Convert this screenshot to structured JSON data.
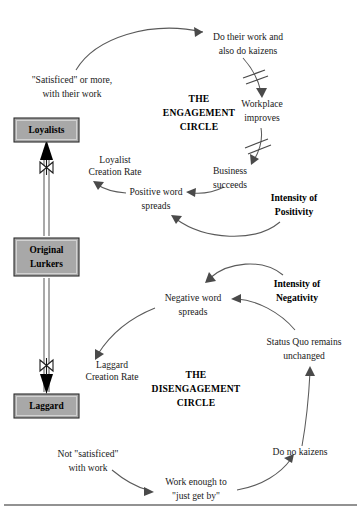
{
  "diagram": {
    "colors": {
      "stock_fill": "#a8a8a8",
      "stock_stroke": "#2b2b2b",
      "link_stroke": "#5a5a5a",
      "text": "#1a1a1a",
      "footer_rule": "#6e6e6e"
    },
    "loops": [
      {
        "id": "engagement",
        "title_lines": [
          "THE",
          "ENGAGEMENT",
          "CIRCLE"
        ]
      },
      {
        "id": "disengagement",
        "title_lines": [
          "THE",
          "DISENGAGEMENT",
          "CIRCLE"
        ]
      }
    ],
    "stocks": [
      {
        "id": "loyalists",
        "lines": [
          "Loyalists"
        ]
      },
      {
        "id": "original-lurkers",
        "lines": [
          "Original",
          "Lurkers"
        ]
      },
      {
        "id": "laggard",
        "lines": [
          "Laggard"
        ]
      }
    ],
    "rates": [
      {
        "id": "loyalist-creation-rate",
        "lines": [
          "Loyalist",
          "Creation Rate"
        ]
      },
      {
        "id": "laggard-creation-rate",
        "lines": [
          "Laggard",
          "Creation Rate"
        ]
      }
    ],
    "nodes": [
      {
        "id": "do-work-kaizens",
        "lines": [
          "Do their work and",
          "also do kaizens"
        ]
      },
      {
        "id": "workplace-improves",
        "lines": [
          "Workplace",
          "improves"
        ]
      },
      {
        "id": "business-succeeds",
        "lines": [
          "Business",
          "succeeds"
        ]
      },
      {
        "id": "positive-word-spreads",
        "lines": [
          "Positive word",
          "spreads"
        ]
      },
      {
        "id": "satisficed-or-more",
        "lines": [
          "\"Satisficed\" or more,",
          "with their work"
        ]
      },
      {
        "id": "intensity-of-positivity",
        "lines": [
          "Intensity of",
          "Positivity"
        ]
      },
      {
        "id": "negative-word-spreads",
        "lines": [
          "Negative word",
          "spreads"
        ]
      },
      {
        "id": "intensity-of-negativity",
        "lines": [
          "Intensity of",
          "Negativity"
        ]
      },
      {
        "id": "status-quo-unchanged",
        "lines": [
          "Status Quo remains",
          "unchanged"
        ]
      },
      {
        "id": "do-no-kaizens",
        "lines": [
          "Do no kaizens"
        ]
      },
      {
        "id": "work-just-get-by",
        "lines": [
          "Work enough to",
          "\"just get by\""
        ]
      },
      {
        "id": "not-satisficed",
        "lines": [
          "Not \"satisficed\"",
          "with work"
        ]
      }
    ],
    "text": {
      "satisficed_line1": "\"Satisficed\" or more,",
      "satisficed_line2": "with their work",
      "do_work_line1": "Do their work and",
      "do_work_line2": "also do kaizens",
      "workplace_line1": "Workplace",
      "workplace_line2": "improves",
      "business_line1": "Business",
      "business_line2": "succeeds",
      "positive_line1": "Positive word",
      "positive_line2": "spreads",
      "intensity_pos_line1": "Intensity of",
      "intensity_pos_line2": "Positivity",
      "loyalist_rate_line1": "Loyalist",
      "loyalist_rate_line2": "Creation Rate",
      "eng_title_line1": "THE",
      "eng_title_line2": "ENGAGEMENT",
      "eng_title_line3": "CIRCLE",
      "loyalists_label": "Loyalists",
      "original_label": "Original",
      "lurkers_label": "Lurkers",
      "laggard_label": "Laggard",
      "negative_line1": "Negative word",
      "negative_line2": "spreads",
      "intensity_neg_line1": "Intensity of",
      "intensity_neg_line2": "Negativity",
      "status_quo_line1": "Status Quo remains",
      "status_quo_line2": "unchanged",
      "do_no_kaizens": "Do no kaizens",
      "work_by_line1": "Work enough to",
      "work_by_line2": "\"just get by\"",
      "not_satisficed_line1": "Not \"satisficed\"",
      "not_satisficed_line2": "with work",
      "laggard_rate_line1": "Laggard",
      "laggard_rate_line2": "Creation Rate",
      "diseng_title_line1": "THE",
      "diseng_title_line2": "DISENGAGEMENT",
      "diseng_title_line3": "CIRCLE"
    }
  }
}
